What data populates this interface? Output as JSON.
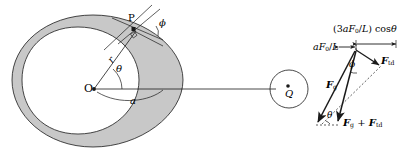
{
  "figure": {
    "name": "tidal-bulge-and-force-vector-diagram",
    "background": "#ffffff",
    "shade_color": "#c8c8c8",
    "stroke_color": "#1a1a1a",
    "width": 418,
    "height": 157
  },
  "left_diagram": {
    "name": "tidal-bulge-geometry",
    "description": "Eccentric annulus representing a deformed body with tidal bulge; centre O, surface point P, radial distance r, angle theta from the line to Q, and angle phi between the radius and the surface normal.",
    "labels": {
      "center": "O",
      "surface_point": "P",
      "radius": "r",
      "theta": "θ",
      "phi": "ϕ",
      "semi_major": "a",
      "companion": "Q"
    }
  },
  "right_diagram": {
    "name": "force-vector-triangle",
    "description": "Vector triangle of gravitational force F_g, tidal force F_td, and their resultant F_g + F_td, with component magnitudes marked at the apex.",
    "labels": {
      "radial_component": "aF₀/L",
      "tangential_component": "(3aF₀/L) cosθ",
      "gravity_vector": "Fₒ",
      "tidal_vector": "Fₜₑ",
      "resultant_vector": "Fₒ + Fₜₑ",
      "phi": "ϕ",
      "theta": "θ"
    },
    "symbols": {
      "F": "F",
      "sub_g": "g",
      "sub_td": "td",
      "sub_0": "0",
      "a": "a",
      "L": "L",
      "coef": "3",
      "cos": "cos",
      "plus": "+",
      "slash": "/",
      "paren_open": "(",
      "paren_close": ")"
    }
  }
}
